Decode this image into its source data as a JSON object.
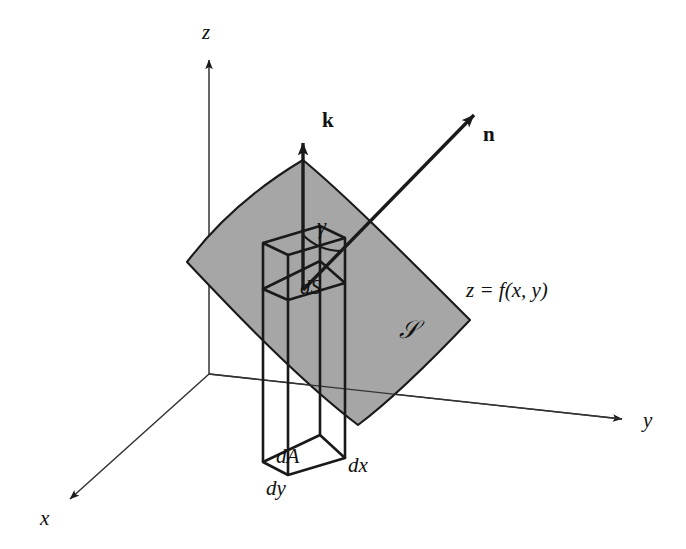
{
  "figure": {
    "background_color": "#ffffff",
    "line_color": "#1a1a1a",
    "surface_fill_color": "#a6a6a6",
    "axes": {
      "x_label": "x",
      "y_label": "y",
      "z_label": "z"
    },
    "vectors": [
      {
        "name": "k-vector",
        "label": "k",
        "description": "unit vertical vector"
      },
      {
        "name": "n-vector",
        "label": "n",
        "description": "unit normal to surface"
      }
    ],
    "angle": {
      "name": "gamma-angle",
      "label": "γ",
      "description": "angle between n and k"
    },
    "surface": {
      "patch_label": "𝒮",
      "equation": "z = f(x, y)",
      "element_label": "dS"
    },
    "base": {
      "area_label": "dA",
      "width_label": "dx",
      "depth_label": "dy"
    }
  }
}
